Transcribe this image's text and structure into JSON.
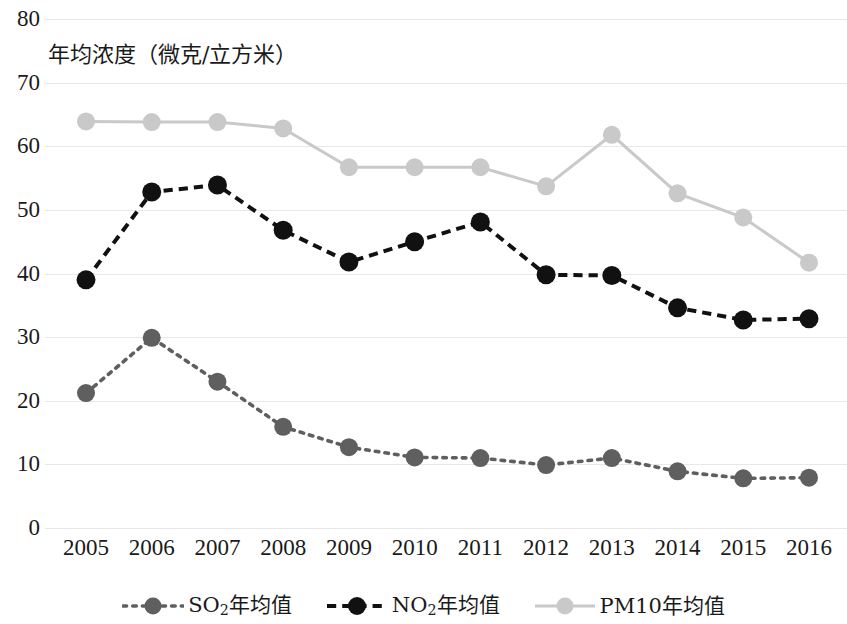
{
  "chart_data": {
    "type": "line",
    "title": "",
    "subtitle": "",
    "xlabel": "",
    "ylabel": "年均浓度（微克/立方米）",
    "categories": [
      "2005",
      "2006",
      "2007",
      "2008",
      "2009",
      "2010",
      "2011",
      "2012",
      "2013",
      "2014",
      "2015",
      "2016"
    ],
    "x": [
      2005,
      2006,
      2007,
      2008,
      2009,
      2010,
      2011,
      2012,
      2013,
      2014,
      2015,
      2016
    ],
    "ylim": [
      0,
      80
    ],
    "yticks": [
      0,
      10,
      20,
      30,
      40,
      50,
      60,
      70,
      80
    ],
    "grid": true,
    "legend_position": "bottom",
    "series": [
      {
        "name": "SO₂年均值",
        "name_base": "SO",
        "name_sub": "2",
        "name_suffix": "年均值",
        "color": "#5f5f5f",
        "line_style": "dotted",
        "values": [
          21.2,
          29.9,
          23.0,
          15.9,
          12.7,
          11.1,
          11.0,
          9.9,
          11.0,
          8.9,
          7.8,
          7.9
        ]
      },
      {
        "name": "NO₂年均值",
        "name_base": "NO",
        "name_sub": "2",
        "name_suffix": "年均值",
        "color": "#111111",
        "line_style": "dashed",
        "values": [
          39.0,
          52.8,
          53.9,
          46.8,
          41.8,
          45.0,
          48.1,
          39.8,
          39.7,
          34.6,
          32.7,
          32.9
        ]
      },
      {
        "name": "PM10年均值",
        "name_base": "PM10",
        "name_sub": "",
        "name_suffix": "年均值",
        "color": "#c9c9c9",
        "line_style": "solid",
        "values": [
          63.9,
          63.8,
          63.8,
          62.8,
          56.7,
          56.7,
          56.7,
          53.7,
          61.8,
          52.6,
          48.8,
          41.7
        ]
      }
    ]
  },
  "axis": {
    "y_tick_labels": [
      "80",
      "70",
      "60",
      "50",
      "40",
      "30",
      "20",
      "10",
      "0"
    ],
    "y_title": "年均浓度（微克/立方米）"
  },
  "legend": {
    "items": [
      {
        "label": "SO₂年均值",
        "base": "SO",
        "sub": "2",
        "suffix": "年均值"
      },
      {
        "label": "NO₂年均值",
        "base": "NO",
        "sub": "2",
        "suffix": "年均值"
      },
      {
        "label": "PM10年均值",
        "base": "PM10",
        "sub": "",
        "suffix": "年均值"
      }
    ]
  },
  "colors": {
    "so2": "#5f5f5f",
    "no2": "#111111",
    "pm10": "#c9c9c9",
    "gridline": "#e8e8e8",
    "text": "#1a1a1a",
    "background": "#ffffff"
  }
}
